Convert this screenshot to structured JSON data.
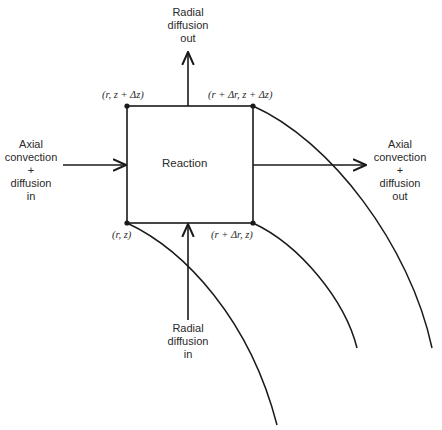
{
  "diagram": {
    "center_label": "Reaction",
    "corners": {
      "top_left": "(r, z + Δz)",
      "top_right": "(r + Δr, z + Δz)",
      "bottom_left": "(r, z)",
      "bottom_right": "(r + Δr, z)"
    },
    "arrows": {
      "top": {
        "lines": [
          "Radial",
          "diffusion",
          "out"
        ]
      },
      "bottom": {
        "lines": [
          "Radial",
          "diffusion",
          "in"
        ]
      },
      "left": {
        "lines": [
          "Axial",
          "convection",
          "+",
          "diffusion",
          "in"
        ]
      },
      "right": {
        "lines": [
          "Axial",
          "convection",
          "+",
          "diffusion",
          "out"
        ]
      }
    },
    "colors": {
      "stroke": "#1a1a1a",
      "background": "#ffffff"
    }
  }
}
